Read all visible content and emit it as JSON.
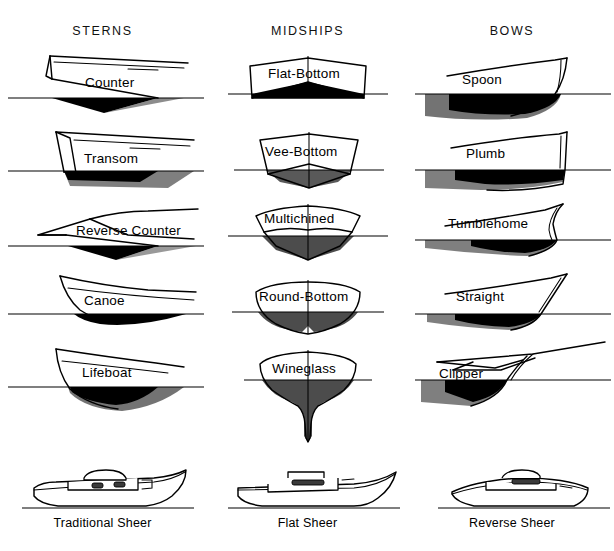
{
  "figure": {
    "background_color": "#ffffff",
    "ink_color": "#000000"
  },
  "columns": [
    {
      "id": "sterns",
      "header": "STERNS"
    },
    {
      "id": "midships",
      "header": "MIDSHIPS"
    },
    {
      "id": "bows",
      "header": "BOWS"
    }
  ],
  "sterns": [
    {
      "label": "Counter"
    },
    {
      "label": "Transom"
    },
    {
      "label": "Reverse Counter"
    },
    {
      "label": "Canoe"
    },
    {
      "label": "Lifeboat"
    }
  ],
  "midships": [
    {
      "label": "Flat-Bottom"
    },
    {
      "label": "Vee-Bottom"
    },
    {
      "label": "Multichined"
    },
    {
      "label": "Round-Bottom"
    },
    {
      "label": "Wineglass"
    }
  ],
  "bows": [
    {
      "label": "Spoon"
    },
    {
      "label": "Plumb"
    },
    {
      "label": "Tumblehome"
    },
    {
      "label": "Straight"
    },
    {
      "label": "Clipper"
    }
  ],
  "sheer_profiles": [
    {
      "label": "Traditional Sheer"
    },
    {
      "label": "Flat Sheer"
    },
    {
      "label": "Reverse Sheer"
    }
  ]
}
